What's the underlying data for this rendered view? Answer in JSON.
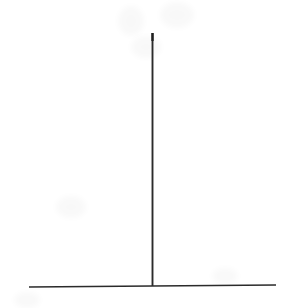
{
  "figure": {
    "name": "impulse-function-plot",
    "background_color": "#ffffff",
    "stroke_color": "#2b2b2b",
    "width": 303,
    "height": 308,
    "caption": "",
    "title": "",
    "axis_labels": {
      "x": "",
      "y": ""
    }
  },
  "chart_data": {
    "type": "line",
    "title": "",
    "subtitle": "",
    "xlabel": "",
    "ylabel": "",
    "grid": false,
    "legend": null,
    "legend_position": "none",
    "axis_ranges": {
      "xlim": [
        0,
        303
      ],
      "ylim": [
        0,
        308
      ]
    },
    "series": [
      {
        "name": "baseline",
        "role": "horizontal-baseline",
        "x": [
          29,
          152,
          276
        ],
        "y": [
          287,
          286,
          285
        ],
        "stroke": "#2b2b2b",
        "stroke_width": 1.6
      },
      {
        "name": "impulse",
        "role": "vertical-spike",
        "x": [
          152.5,
          152.5
        ],
        "y": [
          286,
          33
        ],
        "stroke": "#2b2b2b",
        "stroke_width": 1.9,
        "peak_x": 152.5,
        "peak_y": 33,
        "height_px": 253
      }
    ],
    "annotations": []
  },
  "artifacts": [
    {
      "name": "scan-smudge-top-left",
      "x": 118,
      "y": 6,
      "w": 26,
      "h": 30
    },
    {
      "name": "scan-smudge-top-right",
      "x": 160,
      "y": 2,
      "w": 34,
      "h": 26
    },
    {
      "name": "scan-smudge-upper",
      "x": 131,
      "y": 36,
      "w": 30,
      "h": 22
    },
    {
      "name": "scan-smudge-mid-left",
      "x": 56,
      "y": 196,
      "w": 30,
      "h": 22
    },
    {
      "name": "scan-smudge-lower-left",
      "x": 14,
      "y": 292,
      "w": 26,
      "h": 16
    },
    {
      "name": "scan-smudge-right",
      "x": 212,
      "y": 268,
      "w": 26,
      "h": 16
    }
  ]
}
